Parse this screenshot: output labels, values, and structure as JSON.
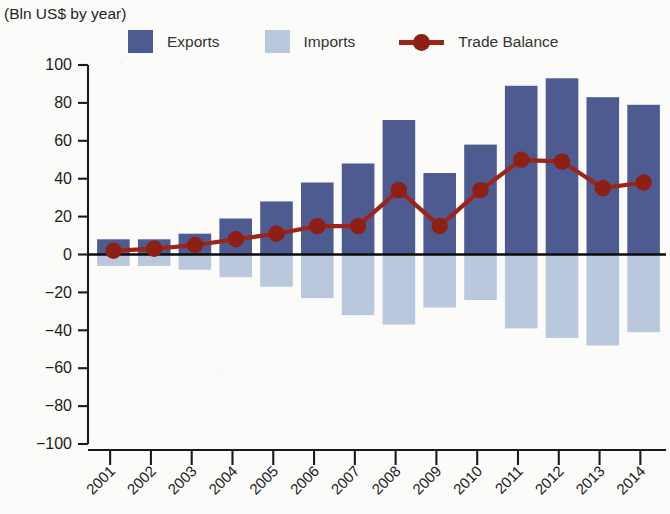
{
  "header": {
    "title": "",
    "subtitle": "(Bln US$ by year)"
  },
  "legend": {
    "position": "top",
    "items": [
      {
        "label": "Exports",
        "type": "swatch",
        "color": "#4e5b91"
      },
      {
        "label": "Imports",
        "type": "swatch",
        "color": "#b9c8dd"
      },
      {
        "label": "Trade Balance",
        "type": "line-marker",
        "color": "#9d2418"
      }
    ]
  },
  "colors": {
    "exports": "#4e5b91",
    "imports": "#b9c8dd",
    "trade_balance": "#9d2418",
    "axis": "#1a1a1a",
    "background": "#fbfbfa"
  },
  "chart_data": {
    "type": "bar",
    "title": "",
    "subtitle": "(Bln US$ by year)",
    "xlabel": "",
    "ylabel": "",
    "ylim": [
      -100,
      100
    ],
    "ytick_values": [
      100,
      80,
      60,
      40,
      20,
      0,
      -20,
      -40,
      -60,
      -80,
      -100
    ],
    "ytick_labels": [
      "100",
      "80",
      "60",
      "40",
      "20",
      "0",
      "−20",
      "−40",
      "−60",
      "−80",
      "−100"
    ],
    "grid": false,
    "legend_position": "top",
    "categories": [
      "2001",
      "2002",
      "2003",
      "2004",
      "2005",
      "2006",
      "2007",
      "2008",
      "2009",
      "2010",
      "2011",
      "2012",
      "2013",
      "2014"
    ],
    "series": [
      {
        "name": "Exports",
        "type": "bar",
        "color": "#4e5b91",
        "values": [
          8,
          8,
          11,
          19,
          28,
          38,
          48,
          71,
          43,
          58,
          89,
          93,
          83,
          79
        ]
      },
      {
        "name": "Imports",
        "type": "bar",
        "color": "#b9c8dd",
        "values": [
          -6,
          -6,
          -8,
          -12,
          -17,
          -23,
          -32,
          -37,
          -28,
          -24,
          -39,
          -44,
          -48,
          -41
        ]
      },
      {
        "name": "Trade Balance",
        "type": "line",
        "color": "#9d2418",
        "values": [
          2,
          3,
          5,
          8,
          11,
          15,
          15,
          34,
          15,
          34,
          50,
          49,
          35,
          38
        ]
      }
    ]
  }
}
